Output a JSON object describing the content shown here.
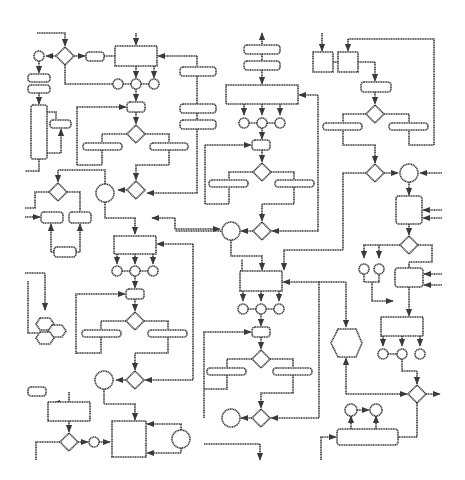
{
  "diagram": {
    "type": "process-flow-diagram",
    "text_labels": [],
    "colors": {
      "stroke": "#3a3a3a",
      "background": "#ffffff"
    },
    "shape_kinds": [
      "rectangle",
      "rounded-rectangle",
      "pill",
      "diamond",
      "circle",
      "hexagon",
      "arrow"
    ]
  }
}
